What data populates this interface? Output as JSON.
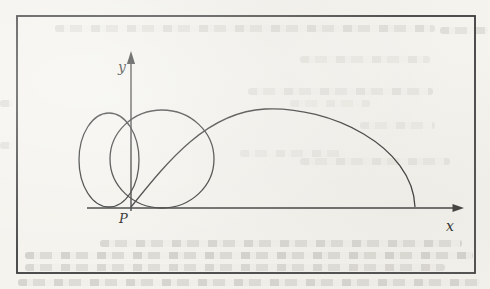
{
  "figure": {
    "paper_color": "#f4f3ee",
    "ink_color": "#3c3c3c",
    "frame": {
      "x": 17,
      "y": 16,
      "w": 458,
      "h": 257
    },
    "axes": {
      "x": {
        "line": "M 87 208 L 455 208",
        "arrow_points": "464,208 452.5,203.9 452.5,212.1",
        "label": "x",
        "label_x": 446,
        "label_y": 231
      },
      "y": {
        "line": "M 131 211 L 131 62",
        "arrow_points": "131,51 126.9,64 135.1,64",
        "label": "y",
        "label_x": 118,
        "label_y": 72
      }
    },
    "point": {
      "label": "P",
      "label_x": 119,
      "label_y": 223
    },
    "curves": {
      "left_ellipse": {
        "cx": 109,
        "cy": 160,
        "rx": 30,
        "ry": 47
      },
      "right_circle": {
        "cx": 162,
        "cy": 159,
        "rx": 52,
        "ry": 49
      },
      "big_ellipse": "M 131 207 C 168 161 207 112 265 109 C 330 106 413 146 415 207"
    }
  },
  "scan_artifacts": [
    {
      "x": 55,
      "y": 25,
      "w": 380,
      "opacity": 0.3
    },
    {
      "x": 440,
      "y": 27,
      "w": 48,
      "opacity": 0.3
    },
    {
      "x": 300,
      "y": 56,
      "w": 130,
      "opacity": 0.2
    },
    {
      "x": 248,
      "y": 88,
      "w": 185,
      "opacity": 0.22
    },
    {
      "x": 290,
      "y": 100,
      "w": 80,
      "opacity": 0.15
    },
    {
      "x": 360,
      "y": 122,
      "w": 75,
      "opacity": 0.16
    },
    {
      "x": 240,
      "y": 150,
      "w": 105,
      "opacity": 0.18
    },
    {
      "x": 300,
      "y": 158,
      "w": 150,
      "opacity": 0.2
    },
    {
      "x": 0,
      "y": 100,
      "w": 13,
      "opacity": 0.3
    },
    {
      "x": 0,
      "y": 142,
      "w": 13,
      "opacity": 0.25
    },
    {
      "x": 100,
      "y": 240,
      "w": 362,
      "opacity": 0.4
    },
    {
      "x": 25,
      "y": 252,
      "w": 448,
      "opacity": 0.45
    },
    {
      "x": 25,
      "y": 264,
      "w": 420,
      "opacity": 0.38
    },
    {
      "x": 18,
      "y": 279,
      "w": 462,
      "opacity": 0.42
    }
  ]
}
